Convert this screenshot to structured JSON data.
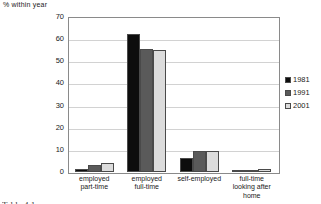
{
  "chart_data": {
    "type": "bar",
    "title": "",
    "xlabel": "",
    "ylabel": "%  within year",
    "ylim": [
      0,
      70
    ],
    "yticks": [
      70,
      60,
      50,
      40,
      30,
      20,
      10,
      0
    ],
    "grid": true,
    "legend_position": "right",
    "categories": [
      "employed\npart-time",
      "employed\nfull-time",
      "self-employed",
      "full-time\nlooking after\nhome"
    ],
    "series": [
      {
        "name": "1981",
        "color": "#0d0d0d",
        "values": [
          1.5,
          62.3,
          6.4,
          0.5
        ]
      },
      {
        "name": "1991",
        "color": "#5a5a5a",
        "values": [
          3.0,
          55.5,
          9.6,
          0.8
        ]
      },
      {
        "name": "2001",
        "color": "#dcdcdc",
        "values": [
          4.2,
          55.3,
          9.5,
          1.3
        ]
      }
    ]
  },
  "footer": {
    "fragment": "Table 4.1"
  }
}
